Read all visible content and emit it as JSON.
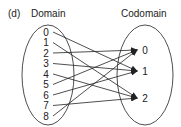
{
  "part_label": "(d)",
  "domain_title": "Domain",
  "codomain_title": "Codomain",
  "domain": [
    "0",
    "1",
    "2",
    "3",
    "4",
    "5",
    "6",
    "7",
    "8"
  ],
  "codomain": [
    "0",
    "1",
    "2"
  ],
  "mapping": [
    {
      "from": "0",
      "to": "1"
    },
    {
      "from": "1",
      "to": "2"
    },
    {
      "from": "2",
      "to": "0"
    },
    {
      "from": "3",
      "to": "1"
    },
    {
      "from": "4",
      "to": "2"
    },
    {
      "from": "5",
      "to": "0"
    },
    {
      "from": "6",
      "to": "1"
    },
    {
      "from": "7",
      "to": "2"
    },
    {
      "from": "8",
      "to": "0"
    }
  ],
  "colors": {
    "stroke": "#222222",
    "background": "#ffffff"
  }
}
